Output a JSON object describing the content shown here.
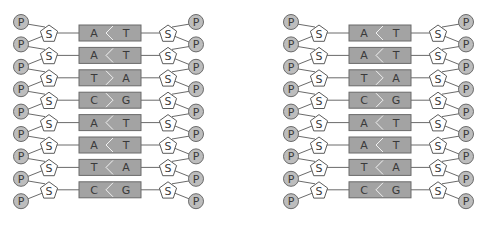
{
  "diagrams": [
    {
      "name": "dna-ladder-left",
      "rows": [
        {
          "left": "A",
          "right": "T",
          "chevron": "left"
        },
        {
          "left": "A",
          "right": "T",
          "chevron": "left"
        },
        {
          "left": "T",
          "right": "A",
          "chevron": "right"
        },
        {
          "left": "C",
          "right": "G",
          "chevron": "right"
        },
        {
          "left": "A",
          "right": "T",
          "chevron": "left"
        },
        {
          "left": "A",
          "right": "T",
          "chevron": "left"
        },
        {
          "left": "T",
          "right": "A",
          "chevron": "left"
        },
        {
          "left": "C",
          "right": "G",
          "chevron": "left"
        }
      ]
    },
    {
      "name": "dna-ladder-right",
      "rows": [
        {
          "left": "A",
          "right": "T",
          "chevron": "left"
        },
        {
          "left": "A",
          "right": "T",
          "chevron": "left"
        },
        {
          "left": "T",
          "right": "A",
          "chevron": "right"
        },
        {
          "left": "C",
          "right": "G",
          "chevron": "right"
        },
        {
          "left": "A",
          "right": "T",
          "chevron": "left"
        },
        {
          "left": "A",
          "right": "T",
          "chevron": "left"
        },
        {
          "left": "T",
          "right": "A",
          "chevron": "left"
        },
        {
          "left": "C",
          "right": "G",
          "chevron": "left"
        }
      ]
    }
  ],
  "labels": {
    "phosphate": "P",
    "sugar": "S"
  },
  "colors": {
    "phosphate_fill": "#bdbdbd",
    "sugar_fill": "#ffffff",
    "base_pair_fill": "#a3a3a3",
    "outline": "#6a6a6a",
    "text": "#3a3a3a"
  }
}
